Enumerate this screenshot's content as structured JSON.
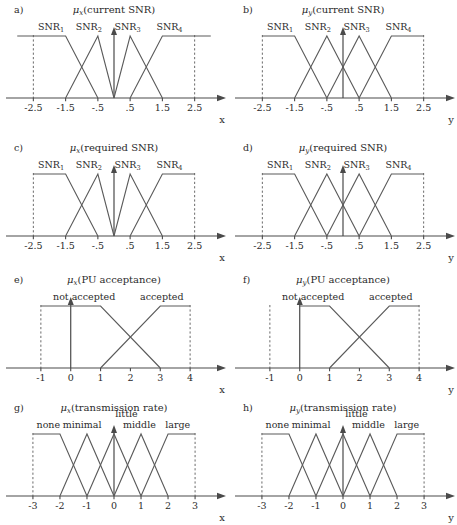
{
  "figure": {
    "width": 457,
    "height": 525,
    "background": "#ffffff",
    "ink_color": "#2b2b2b",
    "line_color": "#5a5a5a",
    "axis_color": "#4a4a4a",
    "dash_color": "#6b6b6b"
  },
  "chart_data": [
    {
      "id": "a",
      "type": "line",
      "panel_label": "a)",
      "title_mu": "μ",
      "title_sub": "x",
      "title_rest": "(current SNR)",
      "title": "μ_x(current SNR)",
      "xlabel": "x",
      "ylabel": "",
      "xlim": [
        -3.1,
        3.1
      ],
      "ylim": [
        0,
        1.15
      ],
      "grid": false,
      "legend": "inline-labels",
      "tick_labels": [
        "-2.5",
        "-1.5",
        "-.5",
        ".5",
        "1.5",
        "2.5"
      ],
      "tick_values": [
        -2.5,
        -1.5,
        -0.5,
        0.5,
        1.5,
        2.5
      ],
      "dashed_verticals": [
        -2.5,
        2.5
      ],
      "series": [
        {
          "name": "SNR",
          "sub": "1",
          "label_x": -1.95,
          "points": [
            [
              -3.0,
              1
            ],
            [
              -1.5,
              1
            ],
            [
              -0.5,
              0
            ]
          ]
        },
        {
          "name": "SNR",
          "sub": "2",
          "label_x": -0.78,
          "points": [
            [
              -1.5,
              0
            ],
            [
              -0.5,
              1
            ],
            [
              0.0,
              0
            ]
          ]
        },
        {
          "name": "SNR",
          "sub": "3",
          "label_x": 0.42,
          "points": [
            [
              0.0,
              0
            ],
            [
              0.5,
              1
            ],
            [
              1.5,
              0
            ]
          ]
        },
        {
          "name": "SNR",
          "sub": "4",
          "label_x": 1.72,
          "points": [
            [
              0.5,
              0
            ],
            [
              1.5,
              1
            ],
            [
              3.0,
              1
            ]
          ]
        }
      ]
    },
    {
      "id": "b",
      "type": "line",
      "panel_label": "b)",
      "title_mu": "μ",
      "title_sub": "y",
      "title_rest": "(current SNR)",
      "title": "μ_y(current SNR)",
      "xlabel": "y",
      "ylabel": "",
      "xlim": [
        -3.1,
        3.1
      ],
      "ylim": [
        0,
        1.15
      ],
      "grid": false,
      "legend": "inline-labels",
      "tick_labels": [
        "-2.5",
        "-1.5",
        "-.5",
        ".5",
        "1.5",
        "2.5"
      ],
      "tick_values": [
        -2.5,
        -1.5,
        -0.5,
        0.5,
        1.5,
        2.5
      ],
      "dashed_verticals": [
        -2.5,
        2.5
      ],
      "series": [
        {
          "name": "SNR",
          "sub": "1",
          "label_x": -1.95,
          "points": [
            [
              -2.5,
              1
            ],
            [
              -1.5,
              1
            ],
            [
              -0.5,
              0
            ]
          ]
        },
        {
          "name": "SNR",
          "sub": "2",
          "label_x": -0.78,
          "points": [
            [
              -1.5,
              0
            ],
            [
              -0.5,
              1
            ],
            [
              0.5,
              0
            ]
          ]
        },
        {
          "name": "SNR",
          "sub": "3",
          "label_x": 0.42,
          "points": [
            [
              -0.5,
              0
            ],
            [
              0.5,
              1
            ],
            [
              1.5,
              0
            ]
          ]
        },
        {
          "name": "SNR",
          "sub": "4",
          "label_x": 1.72,
          "points": [
            [
              0.5,
              0
            ],
            [
              1.5,
              1
            ],
            [
              2.5,
              1
            ]
          ]
        }
      ]
    },
    {
      "id": "c",
      "type": "line",
      "panel_label": "c)",
      "title_mu": "μ",
      "title_sub": "x",
      "title_rest": "(required SNR)",
      "title": "μ_x(required SNR)",
      "xlabel": "x",
      "ylabel": "",
      "xlim": [
        -3.1,
        3.1
      ],
      "ylim": [
        0,
        1.15
      ],
      "grid": false,
      "legend": "inline-labels",
      "tick_labels": [
        "-2.5",
        "-1.5",
        "-.5",
        ".5",
        "1.5",
        "2.5"
      ],
      "tick_values": [
        -2.5,
        -1.5,
        -0.5,
        0.5,
        1.5,
        2.5
      ],
      "dashed_verticals": [
        -2.5,
        2.5
      ],
      "series": [
        {
          "name": "SNR",
          "sub": "1",
          "label_x": -1.95,
          "points": [
            [
              -2.5,
              1
            ],
            [
              -1.5,
              1
            ],
            [
              -0.5,
              0
            ]
          ]
        },
        {
          "name": "SNR",
          "sub": "2",
          "label_x": -0.78,
          "points": [
            [
              -1.5,
              0
            ],
            [
              -0.5,
              1
            ],
            [
              0.0,
              0
            ]
          ]
        },
        {
          "name": "SNR",
          "sub": "3",
          "label_x": 0.42,
          "points": [
            [
              0.0,
              0
            ],
            [
              0.5,
              1
            ],
            [
              1.5,
              0
            ]
          ]
        },
        {
          "name": "SNR",
          "sub": "4",
          "label_x": 1.72,
          "points": [
            [
              0.5,
              0
            ],
            [
              1.5,
              1
            ],
            [
              2.5,
              1
            ]
          ]
        }
      ]
    },
    {
      "id": "d",
      "type": "line",
      "panel_label": "d)",
      "title_mu": "μ",
      "title_sub": "y",
      "title_rest": "(required SNR)",
      "title": "μ_y(required SNR)",
      "xlabel": "y",
      "ylabel": "",
      "xlim": [
        -3.1,
        3.1
      ],
      "ylim": [
        0,
        1.15
      ],
      "grid": false,
      "legend": "inline-labels",
      "tick_labels": [
        "-2.5",
        "-1.5",
        "-.5",
        ".5",
        "1.5",
        "2.5"
      ],
      "tick_values": [
        -2.5,
        -1.5,
        -0.5,
        0.5,
        1.5,
        2.5
      ],
      "dashed_verticals": [
        -2.5,
        2.5
      ],
      "series": [
        {
          "name": "SNR",
          "sub": "1",
          "label_x": -1.95,
          "points": [
            [
              -2.5,
              1
            ],
            [
              -1.5,
              1
            ],
            [
              -0.5,
              0
            ]
          ]
        },
        {
          "name": "SNR",
          "sub": "2",
          "label_x": -0.78,
          "points": [
            [
              -1.5,
              0
            ],
            [
              -0.5,
              1
            ],
            [
              0.5,
              0
            ]
          ]
        },
        {
          "name": "SNR",
          "sub": "3",
          "label_x": 0.42,
          "points": [
            [
              -0.5,
              0
            ],
            [
              0.5,
              1
            ],
            [
              1.5,
              0
            ]
          ]
        },
        {
          "name": "SNR",
          "sub": "4",
          "label_x": 1.72,
          "points": [
            [
              0.5,
              0
            ],
            [
              1.5,
              1
            ],
            [
              2.5,
              1
            ]
          ]
        }
      ]
    },
    {
      "id": "e",
      "type": "line",
      "panel_label": "e)",
      "title_mu": "μ",
      "title_sub": "x",
      "title_rest": "(PU acceptance)",
      "title": "μ_x(PU acceptance)",
      "xlabel": "x",
      "ylabel": "",
      "xlim": [
        -1.9,
        4.8
      ],
      "ylim": [
        0,
        1.15
      ],
      "grid": false,
      "legend": "inline-labels",
      "tick_labels": [
        "-1",
        "0",
        "1",
        "2",
        "3",
        "4"
      ],
      "tick_values": [
        -1,
        0,
        1,
        2,
        3,
        4
      ],
      "dashed_verticals": [
        -1,
        4
      ],
      "series": [
        {
          "name": "not accepted",
          "sub": "",
          "label_x": 0.45,
          "points": [
            [
              -1,
              1
            ],
            [
              1,
              1
            ],
            [
              3,
              0
            ]
          ]
        },
        {
          "name": "accepted",
          "sub": "",
          "label_x": 3.05,
          "points": [
            [
              1,
              0
            ],
            [
              3,
              1
            ],
            [
              4,
              1
            ]
          ]
        }
      ]
    },
    {
      "id": "f",
      "type": "line",
      "panel_label": "f)",
      "title_mu": "μ",
      "title_sub": "y",
      "title_rest": "(PU acceptance)",
      "title": "μ_y(PU acceptance)",
      "xlabel": "y",
      "ylabel": "",
      "xlim": [
        -1.9,
        4.8
      ],
      "ylim": [
        0,
        1.15
      ],
      "grid": false,
      "legend": "inline-labels",
      "tick_labels": [
        "-1",
        "0",
        "1",
        "2",
        "3",
        "4"
      ],
      "tick_values": [
        -1,
        0,
        1,
        2,
        3,
        4
      ],
      "dashed_verticals": [
        -1,
        4
      ],
      "series": [
        {
          "name": "not accepted",
          "sub": "",
          "label_x": 0.45,
          "points": [
            [
              0,
              1
            ],
            [
              1,
              1
            ],
            [
              3,
              0
            ]
          ]
        },
        {
          "name": "accepted",
          "sub": "",
          "label_x": 3.05,
          "points": [
            [
              1,
              0
            ],
            [
              3,
              1
            ],
            [
              4,
              1
            ]
          ]
        }
      ]
    },
    {
      "id": "g",
      "type": "line",
      "panel_label": "g)",
      "title_mu": "μ",
      "title_sub": "x",
      "title_rest": "(transmission rate)",
      "title": "μ_x(transmission rate)",
      "xlabel": "x",
      "ylabel": "",
      "xlim": [
        -3.7,
        3.7
      ],
      "ylim": [
        0,
        1.15
      ],
      "grid": false,
      "legend": "inline-labels",
      "tick_labels": [
        "-3",
        "-2",
        "-1",
        "0",
        "1",
        "2",
        "3"
      ],
      "tick_values": [
        -3,
        -2,
        -1,
        0,
        1,
        2,
        3
      ],
      "dashed_verticals": [
        -3,
        3
      ],
      "series": [
        {
          "name": "none",
          "sub": "",
          "label_x": -2.43,
          "points": [
            [
              -3,
              1
            ],
            [
              -2,
              1
            ],
            [
              -1,
              0
            ]
          ]
        },
        {
          "name": "minimal",
          "sub": "",
          "label_x": -1.18,
          "points": [
            [
              -2,
              0
            ],
            [
              -1,
              1
            ],
            [
              0,
              0
            ]
          ]
        },
        {
          "name": "little",
          "sub": "",
          "label_x": 0.46,
          "label_y_offset": -11,
          "points": [
            [
              -1,
              0
            ],
            [
              0,
              1
            ],
            [
              1,
              0
            ]
          ]
        },
        {
          "name": "middle",
          "sub": "",
          "label_x": 0.94,
          "points": [
            [
              0,
              0
            ],
            [
              1,
              1
            ],
            [
              2,
              0
            ]
          ]
        },
        {
          "name": "large",
          "sub": "",
          "label_x": 2.36,
          "points": [
            [
              1,
              0
            ],
            [
              2,
              1
            ],
            [
              3,
              1
            ]
          ]
        }
      ]
    },
    {
      "id": "h",
      "type": "line",
      "panel_label": "h)",
      "title_mu": "μ",
      "title_sub": "y",
      "title_rest": "(transmission rate)",
      "title": "μ_y(transmission rate)",
      "xlabel": "y",
      "ylabel": "",
      "xlim": [
        -3.7,
        3.7
      ],
      "ylim": [
        0,
        1.15
      ],
      "grid": false,
      "legend": "inline-labels",
      "tick_labels": [
        "-3",
        "-2",
        "-1",
        "0",
        "1",
        "2",
        "3"
      ],
      "tick_values": [
        -3,
        -2,
        -1,
        0,
        1,
        2,
        3
      ],
      "dashed_verticals": [
        -3,
        3
      ],
      "series": [
        {
          "name": "none",
          "sub": "",
          "label_x": -2.43,
          "points": [
            [
              -3,
              1
            ],
            [
              -2,
              1
            ],
            [
              -1,
              0
            ]
          ]
        },
        {
          "name": "minimal",
          "sub": "",
          "label_x": -1.18,
          "points": [
            [
              -2,
              0
            ],
            [
              -1,
              1
            ],
            [
              0,
              0
            ]
          ]
        },
        {
          "name": "little",
          "sub": "",
          "label_x": 0.5,
          "label_y_offset": -11,
          "points": [
            [
              -1,
              0
            ],
            [
              0,
              1
            ],
            [
              1,
              0
            ]
          ]
        },
        {
          "name": "middle",
          "sub": "",
          "label_x": 0.94,
          "points": [
            [
              0,
              0
            ],
            [
              1,
              1
            ],
            [
              2,
              0
            ]
          ]
        },
        {
          "name": "large",
          "sub": "",
          "label_x": 2.36,
          "points": [
            [
              1,
              0
            ],
            [
              2,
              1
            ],
            [
              3,
              1
            ]
          ]
        }
      ]
    }
  ],
  "layout": {
    "columns": 2,
    "rows": 4,
    "panel_positions": [
      {
        "id": "a",
        "left": 0,
        "top": 0
      },
      {
        "id": "b",
        "left": 229,
        "top": 0
      },
      {
        "id": "c",
        "left": 0,
        "top": 138
      },
      {
        "id": "d",
        "left": 229,
        "top": 138
      },
      {
        "id": "e",
        "left": 0,
        "top": 270
      },
      {
        "id": "f",
        "left": 229,
        "top": 270
      },
      {
        "id": "g",
        "left": 0,
        "top": 398
      },
      {
        "id": "h",
        "left": 229,
        "top": 398
      }
    ]
  }
}
